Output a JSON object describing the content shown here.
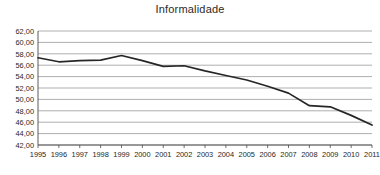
{
  "chart_data": {
    "type": "line",
    "title": "Informalidade",
    "xlabel": "",
    "ylabel": "",
    "x": [
      1995,
      1996,
      1997,
      1998,
      1999,
      2000,
      2001,
      2002,
      2003,
      2004,
      2005,
      2006,
      2007,
      2008,
      2009,
      2010,
      2011
    ],
    "categories": [
      "1995",
      "1996",
      "1997",
      "1998",
      "1999",
      "2000",
      "2001",
      "2002",
      "2003",
      "2004",
      "2005",
      "2006",
      "2007",
      "2008",
      "2009",
      "2010",
      "2011"
    ],
    "values": [
      57.3,
      56.6,
      56.8,
      56.9,
      57.7,
      56.8,
      55.8,
      55.9,
      55.0,
      54.2,
      53.4,
      52.3,
      51.1,
      48.9,
      48.7,
      47.2,
      45.5
    ],
    "series": [
      {
        "name": "Informalidade",
        "values": [
          57.3,
          56.6,
          56.8,
          56.9,
          57.7,
          56.8,
          55.8,
          55.9,
          55.0,
          54.2,
          53.4,
          52.3,
          51.1,
          48.9,
          48.7,
          47.2,
          45.5
        ],
        "color": "#262626"
      }
    ],
    "ylim": [
      42.0,
      62.0
    ],
    "ytick_values": [
      42.0,
      44.0,
      46.0,
      48.0,
      50.0,
      52.0,
      54.0,
      56.0,
      58.0,
      60.0,
      62.0
    ],
    "ytick_labels": [
      "42,00",
      "44,00",
      "46,00",
      "48,00",
      "50,00",
      "52,00",
      "54,00",
      "56,00",
      "58,00",
      "60,00",
      "62,00"
    ],
    "grid": true,
    "grid_axis": "y",
    "legend": false,
    "legend_position": "none",
    "line_color": "#262626",
    "grid_color": "#8c8c8c",
    "background_color": "#ffffff"
  }
}
